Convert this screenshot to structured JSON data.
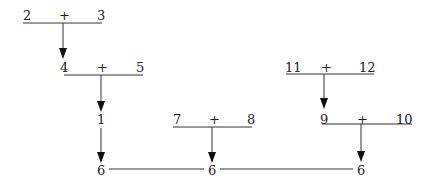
{
  "diagram": {
    "nodes": {
      "n2": "2",
      "p1": "+",
      "n3": "3",
      "n4": "4",
      "p2": "+",
      "n5": "5",
      "n1": "1",
      "n7": "7",
      "p3": "+",
      "n8": "8",
      "n11": "11",
      "p4": "+",
      "n12": "12",
      "n9": "9",
      "p5": "+",
      "n10": "10",
      "r6a": "6",
      "r6b": "6",
      "r6c": "6"
    }
  }
}
